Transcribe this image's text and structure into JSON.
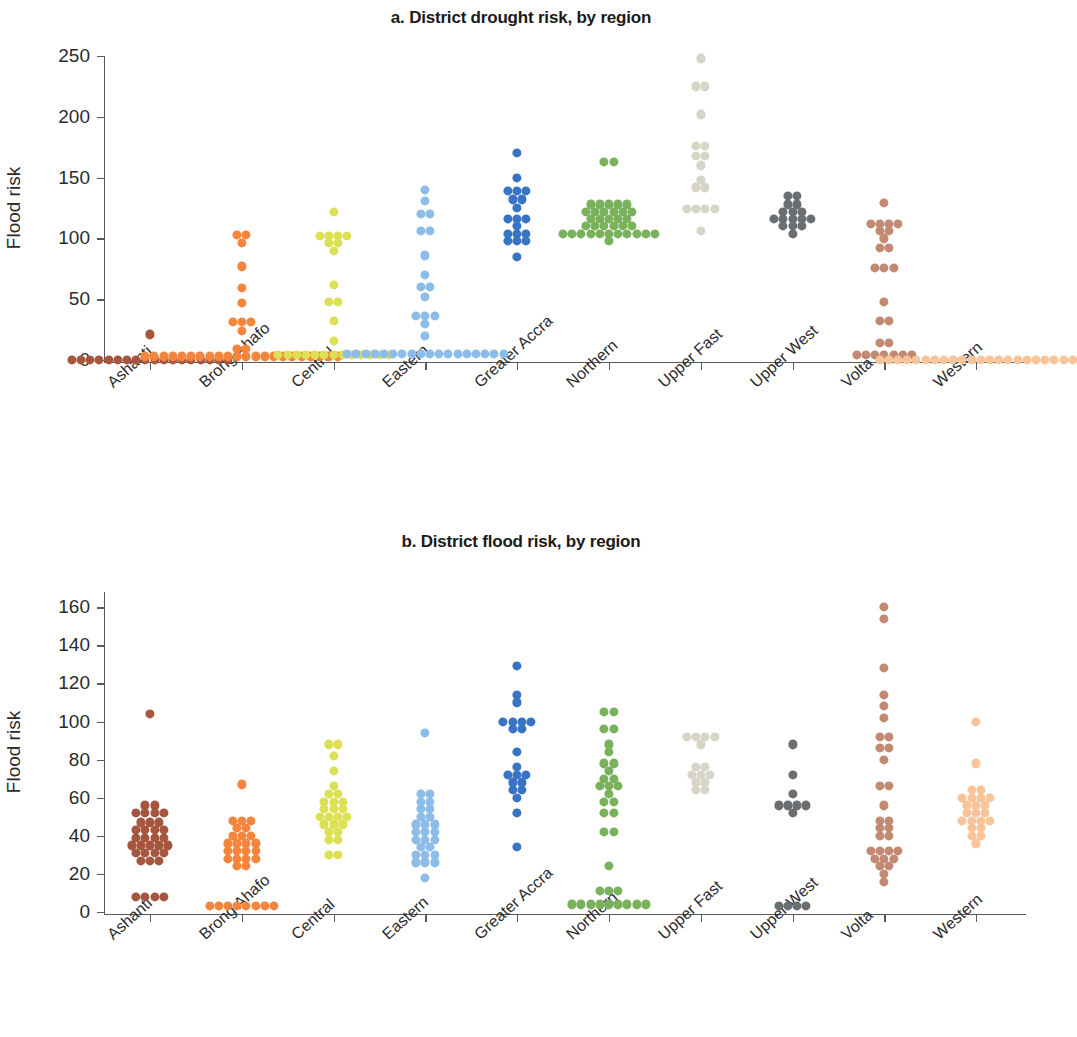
{
  "figure": {
    "background": "#ffffff",
    "axis_color": "#59595b",
    "text_color": "#231f20"
  },
  "panels": [
    {
      "id": "a",
      "title": "a. District drought risk, by region",
      "ylabel": "Flood risk",
      "yticks": [
        "0",
        "50",
        "100",
        "150",
        "200",
        "250"
      ],
      "xticks": [
        "Ashanti",
        "Brong Ahafo",
        "Central",
        "Eastern",
        "Greater Accra",
        "Northern",
        "Upper Fast",
        "Upper West",
        "Volta",
        "Western"
      ]
    },
    {
      "id": "b",
      "title": "b. District flood risk, by region",
      "ylabel": "Flood risk",
      "yticks": [
        "0",
        "20",
        "40",
        "60",
        "80",
        "100",
        "120",
        "140",
        "160"
      ],
      "xticks": [
        "Ashanti",
        "Brong Ahafo",
        "Central",
        "Eastern",
        "Greater Accra",
        "Northern",
        "Upper Fast",
        "Upper West",
        "Volta",
        "Western"
      ]
    }
  ],
  "chart_data": [
    {
      "type": "scatter",
      "panel": "a",
      "title": "a. District drought risk, by region",
      "xlabel": "",
      "ylabel": "Flood risk",
      "ylim": [
        0,
        250
      ],
      "yticks": [
        0,
        50,
        100,
        150,
        200,
        250
      ],
      "grid": false,
      "legend": "none",
      "categories": [
        "Ashanti",
        "Brong Ahafo",
        "Central",
        "Eastern",
        "Greater Accra",
        "Northern",
        "Upper Fast",
        "Upper West",
        "Volta",
        "Western"
      ],
      "colors": [
        "#a6563f",
        "#f4853c",
        "#dde054",
        "#8cbce8",
        "#3873c4",
        "#79b15c",
        "#d6d5c6",
        "#6b6e70",
        "#c28a72",
        "#fac49a"
      ],
      "series": [
        {
          "name": "Ashanti",
          "color": "#a6563f",
          "values": [
            0,
            0,
            0,
            0,
            0,
            0,
            0,
            0,
            0,
            0,
            0,
            0,
            0,
            0,
            0,
            0,
            0,
            0,
            21
          ]
        },
        {
          "name": "Brong Ahafo",
          "color": "#f4853c",
          "values": [
            0,
            0,
            0,
            0,
            0,
            0,
            0,
            0,
            0,
            0,
            0,
            0,
            0,
            0,
            0,
            0,
            0,
            0,
            0,
            0,
            0,
            3,
            6,
            9,
            24,
            27,
            29,
            31,
            47,
            59,
            77,
            96,
            100,
            103
          ]
        },
        {
          "name": "Central",
          "color": "#dde054",
          "values": [
            0,
            0,
            0,
            0,
            0,
            0,
            0,
            0,
            0,
            0,
            0,
            2,
            4,
            16,
            32,
            44,
            48,
            62,
            90,
            94,
            96,
            98,
            99,
            101,
            102,
            122
          ]
        },
        {
          "name": "Eastern",
          "color": "#8cbce8",
          "values": [
            0,
            0,
            0,
            0,
            1,
            1,
            2,
            2,
            2,
            3,
            3,
            3,
            3,
            4,
            4,
            4,
            5,
            5,
            20,
            30,
            32,
            34,
            36,
            52,
            56,
            60,
            70,
            86,
            104,
            106,
            118,
            120,
            131,
            140
          ]
        },
        {
          "name": "Greater Accra",
          "color": "#3873c4",
          "values": [
            85,
            95,
            97,
            98,
            100,
            101,
            104,
            110,
            112,
            114,
            116,
            125,
            130,
            132,
            134,
            136,
            139,
            150,
            170
          ]
        },
        {
          "name": "Northern",
          "color": "#79b15c",
          "values": [
            98,
            99,
            100,
            100,
            101,
            101,
            102,
            102,
            103,
            103,
            104,
            104,
            105,
            106,
            107,
            108,
            109,
            110,
            112,
            113,
            114,
            115,
            116,
            117,
            118,
            119,
            120,
            121,
            122,
            123,
            124,
            125,
            126,
            128,
            160,
            163
          ]
        },
        {
          "name": "Upper Fast",
          "color": "#d6d5c6",
          "values": [
            106,
            120,
            122,
            123,
            124,
            140,
            142,
            148,
            160,
            165,
            168,
            172,
            176,
            202,
            222,
            225,
            248
          ]
        },
        {
          "name": "Upper West",
          "color": "#6b6e70",
          "values": [
            104,
            106,
            108,
            110,
            111,
            112,
            113,
            114,
            116,
            118,
            120,
            122,
            125,
            128,
            132,
            135
          ]
        },
        {
          "name": "Volta",
          "color": "#c28a72",
          "values": [
            0,
            0,
            0,
            0,
            0,
            2,
            4,
            10,
            14,
            30,
            32,
            48,
            72,
            74,
            76,
            88,
            92,
            100,
            104,
            106,
            108,
            109,
            110,
            112,
            129
          ]
        },
        {
          "name": "Western",
          "color": "#fac49a",
          "values": [
            0,
            0,
            0,
            0,
            0,
            0,
            0,
            0,
            0,
            0,
            0,
            0,
            0,
            0,
            0,
            0,
            0,
            0,
            0,
            0,
            0,
            0
          ]
        }
      ]
    },
    {
      "type": "scatter",
      "panel": "b",
      "title": "b. District flood risk, by region",
      "xlabel": "",
      "ylabel": "Flood risk",
      "ylim": [
        0,
        168
      ],
      "yticks": [
        0,
        20,
        40,
        60,
        80,
        100,
        120,
        140,
        160
      ],
      "grid": false,
      "legend": "none",
      "categories": [
        "Ashanti",
        "Brong Ahafo",
        "Central",
        "Eastern",
        "Greater Accra",
        "Northern",
        "Upper Fast",
        "Upper West",
        "Volta",
        "Western"
      ],
      "colors": [
        "#a6563f",
        "#f4853c",
        "#dde054",
        "#8cbce8",
        "#3873c4",
        "#79b15c",
        "#d6d5c6",
        "#6b6e70",
        "#c28a72",
        "#fac49a"
      ],
      "series": [
        {
          "name": "Ashanti",
          "color": "#a6563f",
          "values": [
            5,
            6,
            7,
            8,
            25,
            26,
            27,
            28,
            29,
            30,
            31,
            32,
            33,
            34,
            35,
            35,
            36,
            37,
            38,
            39,
            40,
            41,
            42,
            43,
            44,
            45,
            47,
            49,
            50,
            51,
            52,
            54,
            56,
            104
          ]
        },
        {
          "name": "Brong Ahafo",
          "color": "#f4853c",
          "values": [
            1,
            1,
            1,
            2,
            2,
            2,
            2,
            3,
            22,
            24,
            25,
            26,
            27,
            28,
            29,
            30,
            31,
            32,
            33,
            34,
            35,
            36,
            37,
            38,
            40,
            42,
            44,
            45,
            46,
            48,
            67
          ]
        },
        {
          "name": "Central",
          "color": "#dde054",
          "values": [
            28,
            30,
            36,
            38,
            40,
            42,
            44,
            45,
            46,
            47,
            48,
            49,
            50,
            51,
            52,
            54,
            55,
            56,
            58,
            60,
            62,
            66,
            74,
            82,
            86,
            88
          ]
        },
        {
          "name": "Eastern",
          "color": "#8cbce8",
          "values": [
            18,
            24,
            25,
            26,
            27,
            28,
            30,
            32,
            34,
            35,
            36,
            38,
            40,
            41,
            42,
            44,
            45,
            46,
            48,
            50,
            52,
            54,
            56,
            58,
            60,
            62,
            94
          ]
        },
        {
          "name": "Greater Accra",
          "color": "#3873c4",
          "values": [
            34,
            52,
            60,
            62,
            64,
            66,
            68,
            69,
            70,
            72,
            76,
            84,
            94,
            96,
            97,
            98,
            99,
            100,
            110,
            114,
            129
          ]
        },
        {
          "name": "Northern",
          "color": "#79b15c",
          "values": [
            1,
            1,
            1,
            2,
            2,
            2,
            3,
            3,
            4,
            8,
            10,
            11,
            24,
            40,
            42,
            50,
            52,
            56,
            58,
            62,
            64,
            65,
            66,
            68,
            70,
            74,
            76,
            78,
            84,
            88,
            95,
            96,
            104,
            105
          ]
        },
        {
          "name": "Upper Fast",
          "color": "#d6d5c6",
          "values": [
            62,
            64,
            66,
            68,
            69,
            70,
            72,
            74,
            76,
            88,
            89,
            90,
            91,
            92
          ]
        },
        {
          "name": "Upper West",
          "color": "#6b6e70",
          "values": [
            1,
            2,
            2,
            3,
            52,
            53,
            54,
            55,
            56,
            62,
            72,
            88
          ]
        },
        {
          "name": "Volta",
          "color": "#c28a72",
          "values": [
            16,
            20,
            22,
            24,
            26,
            28,
            28,
            29,
            30,
            31,
            32,
            38,
            40,
            42,
            44,
            46,
            48,
            56,
            64,
            66,
            80,
            84,
            86,
            90,
            92,
            102,
            108,
            114,
            128,
            154,
            160
          ]
        },
        {
          "name": "Western",
          "color": "#fac49a",
          "values": [
            36,
            38,
            40,
            42,
            44,
            45,
            46,
            47,
            48,
            50,
            51,
            52,
            54,
            55,
            56,
            57,
            58,
            59,
            60,
            62,
            64,
            78,
            100
          ]
        }
      ]
    }
  ]
}
